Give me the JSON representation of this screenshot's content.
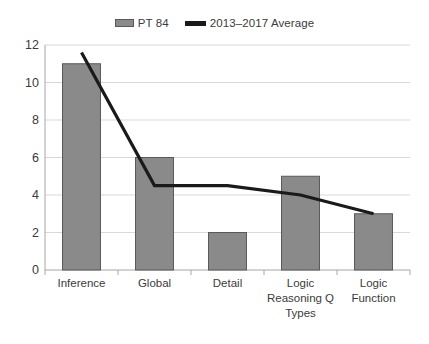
{
  "legend": {
    "entries": [
      {
        "label": "PT 84",
        "marker": "bar-swatch-icon",
        "color": "#8a8a8a"
      },
      {
        "label": "2013–2017 Average",
        "marker": "line-swatch-icon",
        "color": "#1a1a1a"
      }
    ]
  },
  "colors": {
    "bar_fill": "#8a8a8a",
    "bar_stroke": "#595959",
    "line": "#1a1a1a",
    "grid": "#d9d9d9",
    "axis": "#a6a6a6",
    "text": "#3b3b3b",
    "background": "#ffffff"
  },
  "axis": {
    "y_ticks": [
      "0",
      "2",
      "4",
      "6",
      "8",
      "10",
      "12"
    ],
    "x_labels": [
      "Inference",
      "Global",
      "Detail",
      "Logic\nReasoning Q\nTypes",
      "Logic\nFunction"
    ]
  },
  "chart_data": {
    "type": "bar",
    "title": "",
    "xlabel": "",
    "ylabel": "",
    "ylim": [
      0,
      12
    ],
    "yticks": [
      0,
      2,
      4,
      6,
      8,
      10,
      12
    ],
    "grid": true,
    "legend_position": "top-center",
    "categories": [
      "Inference",
      "Global",
      "Detail",
      "Logic Reasoning Q Types",
      "Logic Function"
    ],
    "series": [
      {
        "name": "PT 84",
        "type": "bar",
        "color": "#8a8a8a",
        "values": [
          11,
          6,
          2,
          5,
          3
        ]
      },
      {
        "name": "2013–2017 Average",
        "type": "line",
        "color": "#1a1a1a",
        "values": [
          11.6,
          4.5,
          4.5,
          4.0,
          3.0
        ]
      }
    ]
  }
}
